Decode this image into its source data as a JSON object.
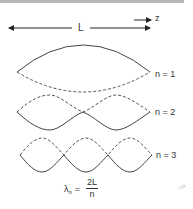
{
  "diagram": {
    "type": "standing-waves",
    "length_label": "L",
    "axis_label": "z",
    "modes": [
      {
        "label": "n = 1",
        "n": 1
      },
      {
        "label": "n = 2",
        "n": 2
      },
      {
        "label": "n = 3",
        "n": 3
      }
    ],
    "formula": {
      "lhs": "λ",
      "lhs_subscript": "n",
      "equals": "=",
      "numerator": "2L",
      "denominator": "n"
    },
    "colors": {
      "line": "#333333",
      "background": "#ffffff",
      "top_bar": "#b8b8b8"
    }
  }
}
